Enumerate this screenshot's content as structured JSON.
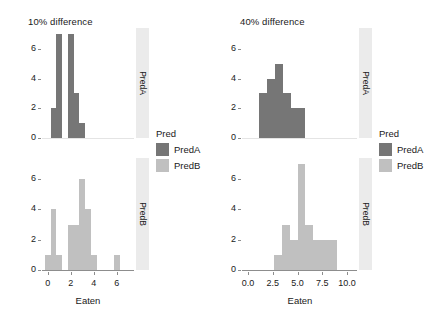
{
  "figure": {
    "background": "#ffffff",
    "colors": {
      "PredA": "#767676",
      "PredB": "#c0c0c0",
      "strip_background": "#ebebeb",
      "axis": "#8d8d8d",
      "text": "#1a1a1a"
    }
  },
  "chart_data": [
    {
      "type": "bar",
      "title": "10% difference",
      "xlabel": "Eaten",
      "ylabel": "",
      "xlim": [
        -0.5,
        7.5
      ],
      "ylim": [
        0,
        7.4
      ],
      "xticks": [
        0,
        2,
        4,
        6
      ],
      "xtick_labels": [
        "0",
        "2",
        "4",
        "6"
      ],
      "yticks": [
        0,
        2,
        4,
        6
      ],
      "ytick_labels": [
        "0",
        "2",
        "4",
        "6"
      ],
      "grid": false,
      "legend": {
        "title": "Pred",
        "position": "right",
        "entries": [
          {
            "name": "PredA",
            "color": "#767676"
          },
          {
            "name": "PredB",
            "color": "#c0c0c0"
          }
        ]
      },
      "facets": [
        {
          "strip_label": "PredA",
          "series_name": "PredA",
          "color": "#767676",
          "bin_width": 0.5,
          "bars": [
            {
              "x0": 0.25,
              "x1": 0.75,
              "count": 2
            },
            {
              "x0": 0.75,
              "x1": 1.25,
              "count": 7
            },
            {
              "x0": 1.75,
              "x1": 2.25,
              "count": 7
            },
            {
              "x0": 2.25,
              "x1": 2.75,
              "count": 3
            },
            {
              "x0": 2.75,
              "x1": 3.25,
              "count": 1
            }
          ]
        },
        {
          "strip_label": "PredB",
          "series_name": "PredB",
          "color": "#c0c0c0",
          "bin_width": 0.5,
          "bars": [
            {
              "x0": -0.25,
              "x1": 0.25,
              "count": 1
            },
            {
              "x0": 0.25,
              "x1": 0.75,
              "count": 4
            },
            {
              "x0": 0.75,
              "x1": 1.25,
              "count": 1
            },
            {
              "x0": 1.75,
              "x1": 2.25,
              "count": 3
            },
            {
              "x0": 2.25,
              "x1": 2.75,
              "count": 3
            },
            {
              "x0": 2.75,
              "x1": 3.25,
              "count": 6
            },
            {
              "x0": 3.25,
              "x1": 3.75,
              "count": 4
            },
            {
              "x0": 3.75,
              "x1": 4.25,
              "count": 1
            },
            {
              "x0": 5.75,
              "x1": 6.25,
              "count": 1
            }
          ]
        }
      ]
    },
    {
      "type": "bar",
      "title": "40% difference",
      "xlabel": "Eaten",
      "ylabel": "",
      "xlim": [
        -0.6,
        11.0
      ],
      "ylim": [
        0,
        7.4
      ],
      "xticks": [
        0.0,
        2.5,
        5.0,
        7.5,
        10.0
      ],
      "xtick_labels": [
        "0.0",
        "2.5",
        "5.0",
        "7.5",
        "10.0"
      ],
      "yticks": [
        0,
        2,
        4,
        6
      ],
      "ytick_labels": [
        "0",
        "2",
        "4",
        "6"
      ],
      "grid": false,
      "legend": {
        "title": "Pred",
        "position": "right",
        "entries": [
          {
            "name": "PredA",
            "color": "#767676"
          },
          {
            "name": "PredB",
            "color": "#c0c0c0"
          }
        ]
      },
      "facets": [
        {
          "strip_label": "PredA",
          "series_name": "PredA",
          "color": "#767676",
          "bin_width": 0.75,
          "bars": [
            {
              "x0": 1.1,
              "x1": 1.9,
              "count": 3
            },
            {
              "x0": 1.9,
              "x1": 2.7,
              "count": 4
            },
            {
              "x0": 2.7,
              "x1": 3.5,
              "count": 5
            },
            {
              "x0": 3.5,
              "x1": 4.3,
              "count": 3
            },
            {
              "x0": 4.3,
              "x1": 5.8,
              "count": 2
            }
          ]
        },
        {
          "strip_label": "PredB",
          "series_name": "PredB",
          "color": "#c0c0c0",
          "bin_width": 0.75,
          "bars": [
            {
              "x0": 2.6,
              "x1": 3.4,
              "count": 1
            },
            {
              "x0": 3.4,
              "x1": 4.2,
              "count": 3
            },
            {
              "x0": 4.2,
              "x1": 5.0,
              "count": 2
            },
            {
              "x0": 5.0,
              "x1": 5.8,
              "count": 7
            },
            {
              "x0": 5.8,
              "x1": 6.6,
              "count": 3
            },
            {
              "x0": 6.6,
              "x1": 9.0,
              "count": 2
            }
          ]
        }
      ]
    }
  ]
}
